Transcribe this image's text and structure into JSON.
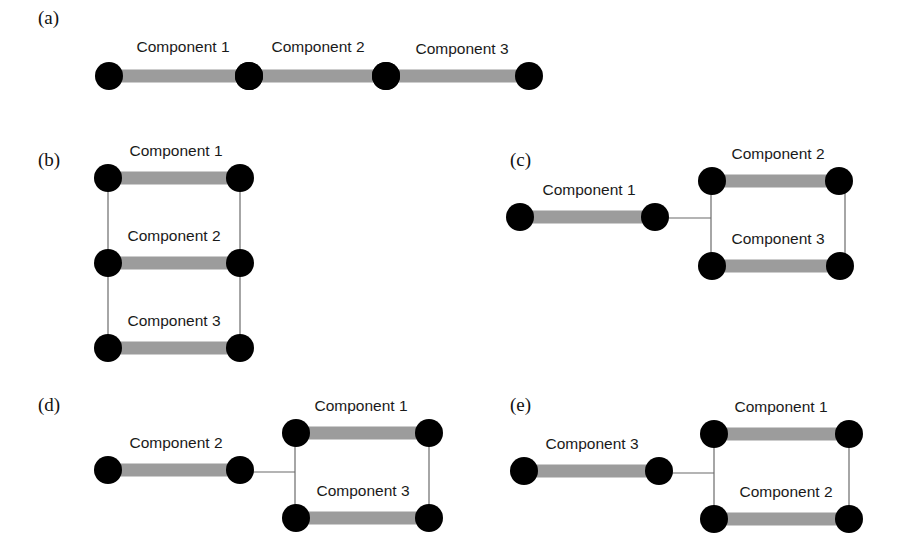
{
  "figure": {
    "panels": [
      {
        "id": "a",
        "label": "(a)",
        "arrangement": "series",
        "label_pos": [
          38,
          24
        ],
        "components": [
          {
            "name": "Component 1",
            "from": [
              109,
              76
            ],
            "to": [
              249,
              76
            ],
            "label_pos": [
              183,
              52
            ]
          },
          {
            "name": "Component 2",
            "from": [
              249,
              76
            ],
            "to": [
              386,
              76
            ],
            "label_pos": [
              318,
              52
            ]
          },
          {
            "name": "Component 3",
            "from": [
              386,
              76
            ],
            "to": [
              529,
              76
            ],
            "label_pos": [
              462,
              54
            ]
          }
        ],
        "wires": []
      },
      {
        "id": "b",
        "label": "(b)",
        "arrangement": "parallel",
        "label_pos": [
          38,
          166
        ],
        "components": [
          {
            "name": "Component 1",
            "from": [
              108,
              178
            ],
            "to": [
              240,
              178
            ],
            "label_pos": [
              176,
              156
            ]
          },
          {
            "name": "Component 2",
            "from": [
              108,
              263
            ],
            "to": [
              240,
              263
            ],
            "label_pos": [
              174,
              241
            ]
          },
          {
            "name": "Component 3",
            "from": [
              108,
              348
            ],
            "to": [
              240,
              348
            ],
            "label_pos": [
              174,
              326
            ]
          }
        ],
        "wires": [
          {
            "from": [
              108,
              178
            ],
            "to": [
              108,
              348
            ]
          },
          {
            "from": [
              240,
              178
            ],
            "to": [
              240,
              348
            ]
          }
        ]
      },
      {
        "id": "c",
        "label": "(c)",
        "arrangement": "series-parallel",
        "label_pos": [
          510,
          166
        ],
        "components": [
          {
            "name": "Component 1",
            "from": [
              520,
              217
            ],
            "to": [
              655,
              217
            ],
            "label_pos": [
              589,
              195
            ]
          },
          {
            "name": "Component 2",
            "from": [
              712,
              181
            ],
            "to": [
              839,
              181
            ],
            "label_pos": [
              778,
              159
            ]
          },
          {
            "name": "Component 3",
            "from": [
              712,
              266
            ],
            "to": [
              840,
              266
            ],
            "label_pos": [
              778,
              244
            ]
          }
        ],
        "wires": [
          {
            "from": [
              655,
              218
            ],
            "to": [
              711,
              218
            ]
          },
          {
            "from": [
              711,
              181
            ],
            "to": [
              711,
              266
            ]
          },
          {
            "from": [
              845,
              181
            ],
            "to": [
              845,
              266
            ]
          }
        ]
      },
      {
        "id": "d",
        "label": "(d)",
        "arrangement": "series-parallel",
        "label_pos": [
          38,
          411
        ],
        "components": [
          {
            "name": "Component 2",
            "from": [
              108,
              470
            ],
            "to": [
              240,
              470
            ],
            "label_pos": [
              176,
              448
            ]
          },
          {
            "name": "Component 1",
            "from": [
              296,
              433
            ],
            "to": [
              429,
              433
            ],
            "label_pos": [
              361,
              411
            ]
          },
          {
            "name": "Component 3",
            "from": [
              296,
              518
            ],
            "to": [
              429,
              518
            ],
            "label_pos": [
              363,
              496
            ]
          }
        ],
        "wires": [
          {
            "from": [
              240,
              472
            ],
            "to": [
              295,
              472
            ]
          },
          {
            "from": [
              295,
              433
            ],
            "to": [
              295,
              518
            ]
          },
          {
            "from": [
              429,
              433
            ],
            "to": [
              429,
              518
            ]
          }
        ]
      },
      {
        "id": "e",
        "label": "(e)",
        "arrangement": "series-parallel",
        "label_pos": [
          510,
          411
        ],
        "components": [
          {
            "name": "Component 3",
            "from": [
              524,
              471
            ],
            "to": [
              659,
              471
            ],
            "label_pos": [
              592,
              449
            ]
          },
          {
            "name": "Component 1",
            "from": [
              714,
              434
            ],
            "to": [
              849,
              434
            ],
            "label_pos": [
              781,
              412
            ]
          },
          {
            "name": "Component 2",
            "from": [
              714,
              519
            ],
            "to": [
              849,
              519
            ],
            "label_pos": [
              786,
              497
            ]
          }
        ],
        "wires": [
          {
            "from": [
              659,
              473
            ],
            "to": [
              714,
              473
            ]
          },
          {
            "from": [
              714,
              434
            ],
            "to": [
              714,
              519
            ]
          },
          {
            "from": [
              849,
              434
            ],
            "to": [
              849,
              519
            ]
          }
        ]
      }
    ],
    "style": {
      "bar_color": "#9c9c9c",
      "node_color": "#000000",
      "wire_color": "#6b6b6b",
      "node_radius": 14
    }
  }
}
